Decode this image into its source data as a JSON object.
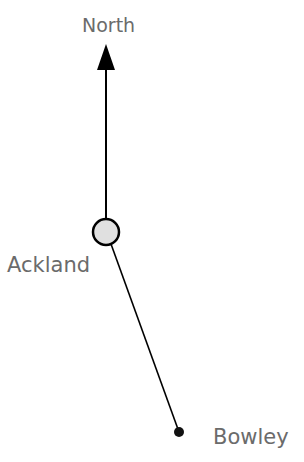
{
  "diagram": {
    "north_label": "North",
    "points": [
      {
        "name": "Ackland",
        "x": 106,
        "y": 232,
        "type": "circle"
      },
      {
        "name": "Bowley",
        "x": 179,
        "y": 432,
        "type": "dot"
      }
    ],
    "colors": {
      "line": "#000000",
      "text": "#6b6b6b",
      "circle_fill": "#e0e0e0"
    }
  },
  "labels": {
    "north": "North",
    "ackland": "Ackland",
    "bowley": "Bowley"
  }
}
